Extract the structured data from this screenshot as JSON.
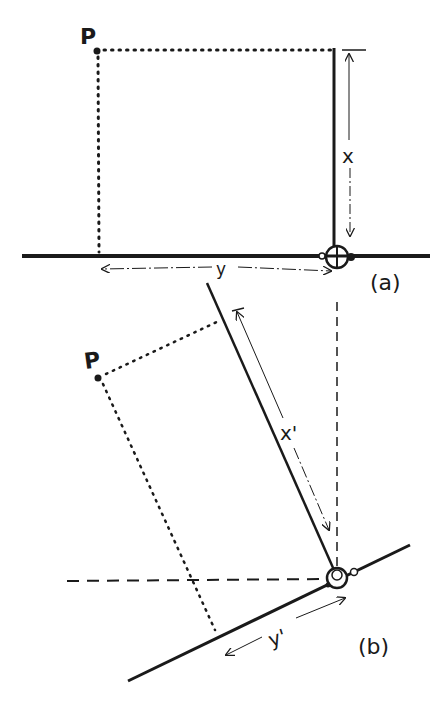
{
  "figure": {
    "panel_a": {
      "caption": "(a)",
      "point_label": "P",
      "x_label": "x",
      "y_label": "y"
    },
    "panel_b": {
      "caption": "(b)",
      "point_label": "P",
      "x_label": "x'",
      "y_label": "y'"
    },
    "colors": {
      "ink": "#1a1a1a",
      "background": "#ffffff"
    }
  }
}
